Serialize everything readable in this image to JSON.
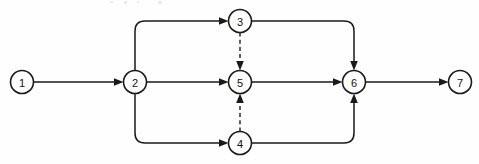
{
  "figure": {
    "kind": "network-activity-diagram",
    "background_color": "#fefefe",
    "ink_color": "#1a1a1a",
    "width": 479,
    "height": 164
  },
  "nodes": [
    {
      "id": "n1",
      "label": "1",
      "cx": 22,
      "cy": 82,
      "r": 11.5
    },
    {
      "id": "n2",
      "label": "2",
      "cx": 135,
      "cy": 82,
      "r": 11.5
    },
    {
      "id": "n3",
      "label": "3",
      "cx": 240,
      "cy": 21,
      "r": 11.5
    },
    {
      "id": "n4",
      "label": "4",
      "cx": 240,
      "cy": 143,
      "r": 11.5
    },
    {
      "id": "n5",
      "label": "5",
      "cx": 240,
      "cy": 82,
      "r": 11.5
    },
    {
      "id": "n6",
      "label": "6",
      "cx": 354,
      "cy": 82,
      "r": 11.5
    },
    {
      "id": "n7",
      "label": "7",
      "cx": 460,
      "cy": 82,
      "r": 11.5
    }
  ],
  "edges": [
    {
      "id": "e1",
      "from": "1",
      "to": "2",
      "style": "solid",
      "name": "edge-1-to-2"
    },
    {
      "id": "e2",
      "from": "2",
      "to": "3",
      "style": "solid",
      "name": "edge-2-to-3"
    },
    {
      "id": "e3",
      "from": "2",
      "to": "5",
      "style": "solid",
      "name": "edge-2-to-5"
    },
    {
      "id": "e4",
      "from": "2",
      "to": "4",
      "style": "solid",
      "name": "edge-2-to-4"
    },
    {
      "id": "e5",
      "from": "3",
      "to": "6",
      "style": "solid",
      "name": "edge-3-to-6"
    },
    {
      "id": "e6",
      "from": "5",
      "to": "6",
      "style": "solid",
      "name": "edge-5-to-6"
    },
    {
      "id": "e7",
      "from": "4",
      "to": "6",
      "style": "solid",
      "name": "edge-4-to-6"
    },
    {
      "id": "e8",
      "from": "6",
      "to": "7",
      "style": "solid",
      "name": "edge-6-to-7"
    },
    {
      "id": "e9",
      "from": "3",
      "to": "5",
      "style": "dashed",
      "name": "edge-3-to-5-dummy"
    },
    {
      "id": "e10",
      "from": "4",
      "to": "5",
      "style": "dashed",
      "name": "edge-4-to-5-dummy"
    }
  ]
}
